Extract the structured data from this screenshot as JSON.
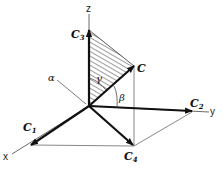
{
  "diagram": {
    "type": "3d-vector-decomposition",
    "axes": {
      "x": {
        "label": "x"
      },
      "y": {
        "label": "y"
      },
      "z": {
        "label": "z"
      }
    },
    "vectors": {
      "C": {
        "label": "C",
        "subscript": ""
      },
      "C1": {
        "label": "C",
        "subscript": "1"
      },
      "C2": {
        "label": "C",
        "subscript": "2"
      },
      "C3": {
        "label": "C",
        "subscript": "3"
      },
      "C4": {
        "label": "C",
        "subscript": "4"
      }
    },
    "angles": {
      "alpha": "α",
      "beta": "β",
      "gamma": "γ"
    },
    "colors": {
      "ink": "#111111",
      "thin_line": "#555555",
      "background": "#ffffff"
    }
  }
}
